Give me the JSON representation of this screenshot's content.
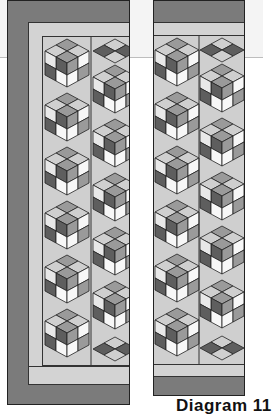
{
  "caption": "Diagram 11",
  "colors": {
    "border_dark": "#7b7b7b",
    "border_light": "#d3d3d3",
    "cube_top_mid": "#9a9a9a",
    "cube_dark": "#5e5e5e",
    "cube_light": "#e8e8e8",
    "cube_white": "#f7f7f7",
    "background_fill": "#cfcfcf",
    "outline": "#222222"
  },
  "panels": [
    {
      "name": "left-quilt-panel",
      "label": "Left panel"
    },
    {
      "name": "right-quilt-panel",
      "label": "Right panel"
    }
  ]
}
